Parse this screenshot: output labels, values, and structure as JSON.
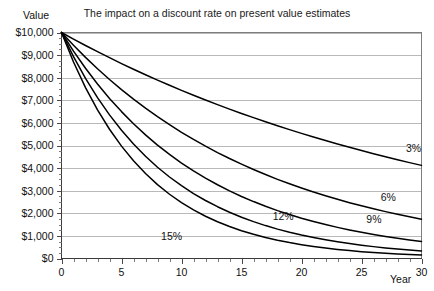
{
  "chart_data": {
    "type": "line",
    "title": "The impact on a discount rate on present value estimates",
    "xlabel": "Year",
    "ylabel": "Value",
    "xlim": [
      0,
      30
    ],
    "ylim": [
      0,
      10000
    ],
    "grid": true,
    "legend_position": "inline-curve-labels",
    "x_tick_labels": [
      "0",
      "5",
      "10",
      "15",
      "20",
      "25",
      "30"
    ],
    "x_tick_values": [
      0,
      5,
      10,
      15,
      20,
      25,
      30
    ],
    "x_minor_tick_step": 1,
    "y_tick_labels": [
      "$0",
      "$1,000",
      "$2,000",
      "$3,000",
      "$4,000",
      "$5,000",
      "$6,000",
      "$7,000",
      "$8,000",
      "$9,000",
      "$10,000"
    ],
    "y_tick_values": [
      0,
      1000,
      2000,
      3000,
      4000,
      5000,
      6000,
      7000,
      8000,
      9000,
      10000
    ],
    "x": [
      0,
      1,
      2,
      3,
      4,
      5,
      6,
      7,
      8,
      9,
      10,
      11,
      12,
      13,
      14,
      15,
      16,
      17,
      18,
      19,
      20,
      21,
      22,
      23,
      24,
      25,
      26,
      27,
      28,
      29,
      30
    ],
    "series": [
      {
        "name": "3%",
        "label": "3%",
        "rate": 0.03,
        "color": "#000000",
        "label_x": 28.7,
        "label_y": 4700,
        "values": [
          10000,
          9709,
          9426,
          9151,
          8885,
          8626,
          8375,
          8131,
          7894,
          7664,
          7441,
          7224,
          7014,
          6810,
          6611,
          6419,
          6232,
          6050,
          5874,
          5703,
          5537,
          5375,
          5219,
          5067,
          4919,
          4776,
          4637,
          4502,
          4371,
          4243,
          4120
        ]
      },
      {
        "name": "6%",
        "label": "6%",
        "rate": 0.06,
        "color": "#000000",
        "label_x": 26.6,
        "label_y": 2560,
        "values": [
          10000,
          9434,
          8900,
          8396,
          7921,
          7473,
          7050,
          6651,
          6274,
          5919,
          5584,
          5268,
          4970,
          4688,
          4423,
          4173,
          3936,
          3714,
          3503,
          3305,
          3118,
          2942,
          2775,
          2618,
          2470,
          2330,
          2198,
          2074,
          1956,
          1846,
          1741
        ]
      },
      {
        "name": "9%",
        "label": "9%",
        "rate": 0.09,
        "color": "#000000",
        "label_x": 25.4,
        "label_y": 1580,
        "values": [
          10000,
          9174,
          8417,
          7722,
          7084,
          6499,
          5963,
          5470,
          5019,
          4604,
          4224,
          3875,
          3555,
          3262,
          2992,
          2745,
          2519,
          2311,
          2120,
          1945,
          1784,
          1637,
          1502,
          1378,
          1264,
          1160,
          1064,
          976,
          895,
          822,
          754
        ]
      },
      {
        "name": "12%",
        "label": "12%",
        "rate": 0.12,
        "color": "#000000",
        "label_x": 17.6,
        "label_y": 1690,
        "values": [
          10000,
          8929,
          7972,
          7118,
          6355,
          5674,
          5066,
          4523,
          4039,
          3606,
          3220,
          2875,
          2567,
          2292,
          2046,
          1827,
          1631,
          1456,
          1300,
          1161,
          1037,
          926,
          826,
          738,
          659,
          588,
          525,
          469,
          419,
          374,
          334
        ]
      },
      {
        "name": "15%",
        "label": "15%",
        "rate": 0.15,
        "color": "#000000",
        "label_x": 8.3,
        "label_y": 810,
        "values": [
          10000,
          8696,
          7561,
          6575,
          5718,
          4972,
          4323,
          3759,
          3269,
          2843,
          2472,
          2149,
          1869,
          1625,
          1413,
          1229,
          1069,
          929,
          808,
          703,
          611,
          531,
          462,
          402,
          349,
          304,
          264,
          229,
          200,
          174,
          151
        ]
      }
    ]
  },
  "clipped_top_text": ""
}
